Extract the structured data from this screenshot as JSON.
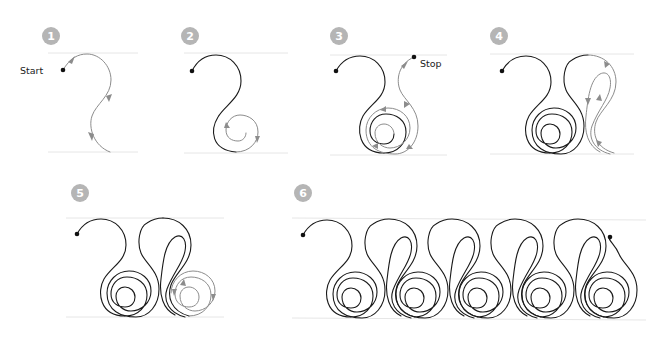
{
  "colors": {
    "badge": "#b5b5b5",
    "badge_text": "#ffffff",
    "stitched_line": "#1a1a1a",
    "current_step_line": "#8c8c8c",
    "guide_line": "#e6e6e6",
    "dot": "#111111"
  },
  "steps": [
    {
      "number": "1",
      "annotation": "Start",
      "description": "Begin at start dot, arc over and S-curve down to baseline"
    },
    {
      "number": "2",
      "description": "Continue into an inward spiral"
    },
    {
      "number": "3",
      "annotation": "Stop",
      "description": "Spiral back out and travel up to stop point"
    },
    {
      "number": "4",
      "description": "Second motif: loop over, teardrop back down to baseline"
    },
    {
      "number": "5",
      "description": "Add spiral to second motif"
    },
    {
      "number": "6",
      "description": "Repeat the motif across the row"
    }
  ],
  "labels": {
    "start": "Start",
    "stop": "Stop"
  }
}
